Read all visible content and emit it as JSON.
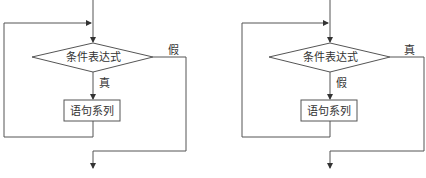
{
  "diagrams": [
    {
      "name": "while-loop-flowchart",
      "condition": "条件表达式",
      "body": "语句系列",
      "branch_down_label": "真",
      "branch_right_label": "假"
    },
    {
      "name": "until-loop-flowchart",
      "condition": "条件表达式",
      "body": "语句系列",
      "branch_down_label": "假",
      "branch_right_label": "真"
    }
  ],
  "colors": {
    "line": "#555555",
    "text": "#333333",
    "background": "#ffffff"
  }
}
